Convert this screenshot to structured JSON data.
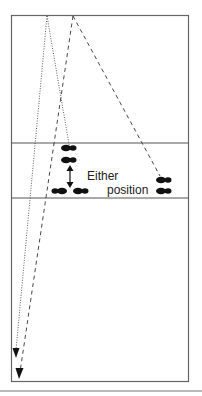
{
  "diagram": {
    "type": "volleyball-court-movement",
    "annotation": {
      "line1": "Either",
      "line2": "position"
    },
    "colors": {
      "court_line": "#555555",
      "path": "#222222",
      "footprint": "#111111",
      "background": "#ffffff"
    },
    "paths": [
      {
        "name": "dotted-left",
        "style": "dotted",
        "from": [
          47,
          15
        ],
        "to": [
          16,
          352
        ],
        "arrow": true
      },
      {
        "name": "dotted-right",
        "style": "dotted",
        "from": [
          47,
          15
        ],
        "to": [
          70,
          150
        ],
        "arrow": false
      },
      {
        "name": "dashed-left",
        "style": "dashed",
        "from": [
          73,
          15
        ],
        "to": [
          19,
          376
        ],
        "arrow": true
      },
      {
        "name": "dashed-right",
        "style": "dashed",
        "from": [
          73,
          15
        ],
        "to": [
          160,
          178
        ],
        "arrow": false
      }
    ]
  }
}
